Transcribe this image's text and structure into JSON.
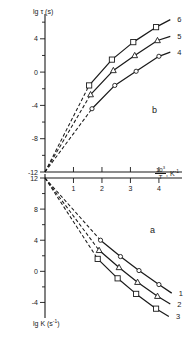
{
  "figure": {
    "panel_b_label": "b",
    "panel_a_label": "a",
    "x_axis_title_prefix": "",
    "x_axis_numerator": "10",
    "x_axis_numerator_exp": "3",
    "x_axis_denominator": "T",
    "x_axis_suffix": ", K",
    "x_axis_suffix_exp": "-1",
    "y_axis_top_title": "lg τ (s)",
    "y_axis_bottom_title_text": "lg K (s",
    "y_axis_bottom_title_exp": "-1",
    "y_axis_bottom_title_close": ")"
  },
  "chart_data": [
    {
      "type": "line",
      "panel": "b",
      "title": "lg τ (s) vs 10³/T",
      "xlabel": "10³/T, K⁻¹",
      "ylabel": "lg τ (s)",
      "xlim": [
        0,
        4.6
      ],
      "ylim": [
        -12,
        6.5
      ],
      "xticks": [
        0,
        1,
        2,
        3,
        4
      ],
      "xtick_labels": [
        "",
        "1",
        "2",
        "3",
        "4"
      ],
      "yticks": [
        -12,
        -10,
        -8,
        -6,
        -4,
        -2,
        0,
        2,
        4,
        6
      ],
      "ytick_labels": [
        "-12",
        "",
        "-8",
        "",
        "-4",
        "",
        "0",
        "",
        "4",
        ""
      ],
      "grid": false,
      "legend": "right-end-of-line",
      "series": [
        {
          "name": "6",
          "marker": "square",
          "label": "6",
          "x": [
            0,
            1.55,
            2.35,
            3.1,
            3.9,
            4.4
          ],
          "y": [
            -12,
            -1.6,
            1.5,
            3.6,
            5.4,
            6.3
          ]
        },
        {
          "name": "5",
          "marker": "triangle",
          "label": "5",
          "x": [
            0,
            1.6,
            2.4,
            3.15,
            3.95,
            4.4
          ],
          "y": [
            -12,
            -2.7,
            0.2,
            2.0,
            3.8,
            4.3
          ]
        },
        {
          "name": "4",
          "marker": "circle",
          "label": "4",
          "x": [
            0,
            1.65,
            2.45,
            3.2,
            4.0,
            4.4
          ],
          "y": [
            -12,
            -4.4,
            -1.6,
            0.1,
            1.9,
            2.4
          ]
        }
      ]
    },
    {
      "type": "line",
      "panel": "a",
      "title": "lg K (s⁻¹) vs 10³/T",
      "xlabel": "10³/T, K⁻¹",
      "ylabel": "lg K (s⁻¹)",
      "xlim": [
        0,
        4.6
      ],
      "ylim": [
        -6,
        12
      ],
      "xticks": [
        0,
        1,
        2,
        3,
        4
      ],
      "xtick_labels": [
        "",
        "1",
        "2",
        "3",
        "4"
      ],
      "yticks": [
        -4,
        -2,
        0,
        2,
        4,
        6,
        8,
        10,
        12
      ],
      "ytick_labels": [
        "-4",
        "",
        "0",
        "",
        "4",
        "",
        "8",
        "",
        "12"
      ],
      "grid": false,
      "legend": "right-end-of-line",
      "series": [
        {
          "name": "1",
          "marker": "circle",
          "label": "1",
          "x": [
            0,
            1.95,
            2.65,
            3.3,
            4.0,
            4.45
          ],
          "y": [
            12,
            4.0,
            1.9,
            0.1,
            -1.7,
            -2.8
          ]
        },
        {
          "name": "2",
          "marker": "triangle",
          "label": "2",
          "x": [
            0,
            1.9,
            2.6,
            3.25,
            3.95,
            4.4
          ],
          "y": [
            12,
            2.7,
            0.5,
            -1.4,
            -3.2,
            -4.2
          ]
        },
        {
          "name": "3",
          "marker": "square",
          "label": "3",
          "x": [
            0,
            1.85,
            2.55,
            3.2,
            3.9,
            4.35
          ],
          "y": [
            12,
            1.6,
            -0.9,
            -2.9,
            -4.8,
            -5.8
          ]
        }
      ]
    }
  ]
}
